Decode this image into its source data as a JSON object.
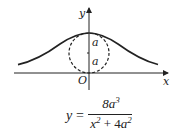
{
  "diagram": {
    "axes": {
      "x_label": "x",
      "y_label": "y",
      "origin_label": "O"
    },
    "circle_labels": [
      "a",
      "a"
    ],
    "curve": "witch of Agnesi",
    "formula": {
      "lhs": "y",
      "equals": "=",
      "numerator": "8a³",
      "denominator": "x² + 4a²"
    },
    "colors": {
      "stroke": "#222222",
      "background": "#ffffff"
    }
  }
}
